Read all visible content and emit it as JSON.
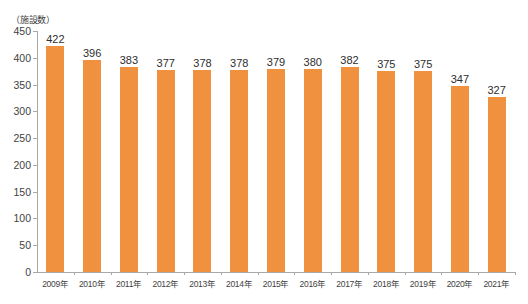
{
  "chart_data": {
    "type": "bar",
    "title": "",
    "subtitle": "",
    "unit_label": "（施設数）",
    "xlabel": "",
    "ylabel": "",
    "ylim": [
      0,
      450
    ],
    "ytick_step": 50,
    "yticks": [
      0,
      50,
      100,
      150,
      200,
      250,
      300,
      350,
      400,
      450
    ],
    "ytick_labels": [
      "0",
      "50",
      "100",
      "150",
      "200",
      "250",
      "300",
      "350",
      "400",
      "450"
    ],
    "grid": false,
    "legend": false,
    "legend_position": "none",
    "bar_color": "#F0913F",
    "axis_color": "#A8A8A8",
    "text_color": "#3F3F3F",
    "value_label_color": "#2E2E2E",
    "categories": [
      "2009年",
      "2010年",
      "2011年",
      "2012年",
      "2013年",
      "2014年",
      "2015年",
      "2016年",
      "2017年",
      "2018年",
      "2019年",
      "2020年",
      "2021年"
    ],
    "values": [
      422,
      396,
      383,
      377,
      378,
      378,
      379,
      380,
      382,
      375,
      375,
      347,
      327
    ],
    "value_labels": [
      "422",
      "396",
      "383",
      "377",
      "378",
      "378",
      "379",
      "380",
      "382",
      "375",
      "375",
      "347",
      "327"
    ],
    "series": [
      {
        "name": "施設数",
        "values": [
          422,
          396,
          383,
          377,
          378,
          378,
          379,
          380,
          382,
          375,
          375,
          347,
          327
        ]
      }
    ]
  }
}
